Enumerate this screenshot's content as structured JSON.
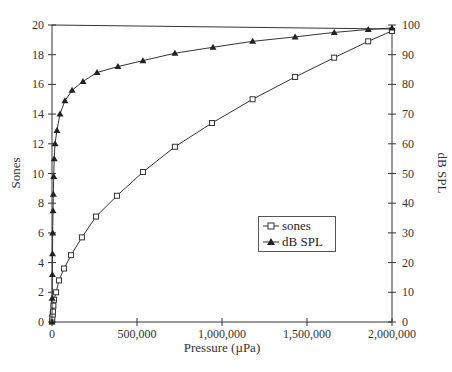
{
  "chart_data": {
    "type": "line",
    "title": "",
    "xlabel": "Pressure (µPa)",
    "ylabel": "Sones",
    "y2label": "dB SPL",
    "xlim": [
      0,
      2000000
    ],
    "ylim": [
      0,
      20
    ],
    "y2lim": [
      0,
      100
    ],
    "grid": false,
    "legend_position": "center-right inside plot",
    "x_ticks": [
      0,
      500000,
      1000000,
      1500000,
      2000000
    ],
    "x_tick_labels": [
      "0",
      "500,000",
      "1,000,000",
      "1,500,000",
      "2,000,000"
    ],
    "y_ticks": [
      0,
      2,
      4,
      6,
      8,
      10,
      12,
      14,
      16,
      18,
      20
    ],
    "y_tick_labels": [
      "0",
      "2",
      "4",
      "6",
      "8",
      "10",
      "12",
      "14",
      "16",
      "18",
      "20"
    ],
    "y2_ticks": [
      0,
      10,
      20,
      30,
      40,
      50,
      60,
      70,
      80,
      90,
      100
    ],
    "y2_tick_labels": [
      "0",
      "10",
      "20",
      "30",
      "40",
      "50",
      "60",
      "70",
      "80",
      "90",
      "100"
    ],
    "series": [
      {
        "name": "sones",
        "marker": "open-square",
        "axis": "left",
        "x": [
          0,
          2000,
          4000,
          6000,
          8000,
          12000,
          24000,
          41000,
          71000,
          112000,
          176000,
          259000,
          382000,
          535000,
          723000,
          941000,
          1180000,
          1430000,
          1660000,
          1860000,
          2000000
        ],
        "values": [
          0.05,
          0.3,
          0.5,
          0.7,
          1.1,
          1.5,
          2.0,
          2.8,
          3.6,
          4.5,
          5.7,
          7.1,
          8.5,
          10.1,
          11.8,
          13.4,
          15.0,
          16.5,
          17.8,
          18.9,
          19.6
        ]
      },
      {
        "name": "dB SPL",
        "marker": "filled-triangle",
        "axis": "right",
        "x": [
          0,
          1000,
          2000,
          3000,
          4000,
          6000,
          8000,
          10000,
          13000,
          18000,
          29000,
          47000,
          76000,
          118000,
          182000,
          265000,
          388000,
          535000,
          723000,
          947000,
          1180000,
          1430000,
          1660000,
          1860000,
          2000000
        ],
        "values": [
          0,
          8,
          16,
          23,
          30,
          37.5,
          43,
          49,
          55,
          60,
          64.5,
          70,
          74.5,
          78,
          81,
          84,
          86,
          88,
          90.5,
          92.5,
          94.5,
          96,
          97.5,
          98.5,
          99
        ]
      }
    ]
  },
  "axes": {
    "xlabel": "Pressure (µPa)",
    "ylabel_left": "Sones",
    "ylabel_right": "dB SPL"
  },
  "legend": {
    "items": [
      {
        "label": "sones"
      },
      {
        "label": "dB SPL"
      }
    ]
  }
}
